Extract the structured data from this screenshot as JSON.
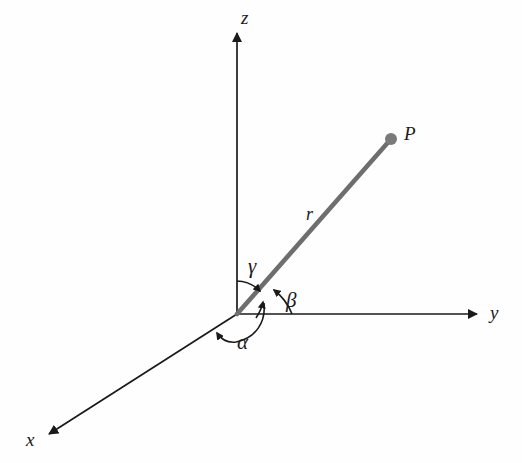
{
  "figure": {
    "kind": "3d-cartesian-direction-angles",
    "background_color": "#fefefe",
    "axis_color": "#1a1a1a",
    "ray_color": "#6e6e6e",
    "arc_color": "#1a1a1a",
    "point_color": "#7a7a7a"
  },
  "axes": [
    {
      "id": "z",
      "label": "z",
      "label_x": 241,
      "label_y": 8,
      "from": [
        237,
        314
      ],
      "to": [
        237,
        30
      ]
    },
    {
      "id": "y",
      "label": "y",
      "label_x": 490,
      "label_y": 303,
      "from": [
        237,
        314
      ],
      "to": [
        480,
        314
      ]
    },
    {
      "id": "x",
      "label": "x",
      "label_x": 26,
      "label_y": 430,
      "from": [
        237,
        314
      ],
      "to": [
        46,
        436
      ]
    }
  ],
  "ray": {
    "label": "r",
    "label_x": 306,
    "label_y": 205,
    "from": [
      237,
      314
    ],
    "to": [
      391,
      139
    ],
    "width": 4.5
  },
  "point": {
    "label": "P",
    "label_x": 404,
    "label_y": 124,
    "x": 391,
    "y": 139,
    "radius": 6
  },
  "angles": [
    {
      "id": "alpha",
      "label": "α",
      "label_x": 237,
      "label_y": 332,
      "measured_from": "x-axis",
      "measured_to": "r"
    },
    {
      "id": "beta",
      "label": "β",
      "label_x": 286,
      "label_y": 290,
      "measured_from": "y-axis",
      "measured_to": "r"
    },
    {
      "id": "gamma",
      "label": "γ",
      "label_x": 248,
      "label_y": 256,
      "measured_from": "z-axis",
      "measured_to": "r"
    }
  ]
}
